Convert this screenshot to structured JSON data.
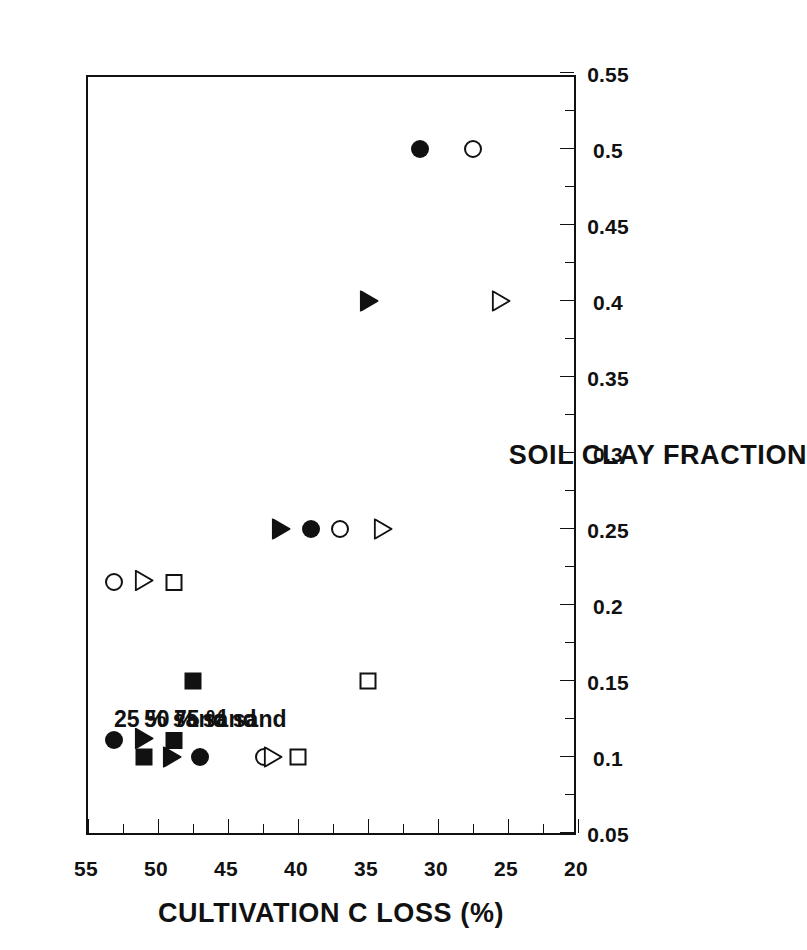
{
  "chart_data": {
    "type": "scatter",
    "title": "",
    "orientation": "rotated-90-ccw",
    "xlabel": "SOIL CLAY FRACTION",
    "ylabel": "CULTIVATION C LOSS (%)",
    "xlim": [
      0.05,
      0.55
    ],
    "ylim": [
      20,
      55
    ],
    "y_axis_inverted_on_screen": true,
    "grid": "dotted gridlines at every major y tick",
    "x_ticks": [
      "0.05",
      "0.1",
      "0.15",
      "0.2",
      "0.25",
      "0.3",
      "0.35",
      "0.4",
      "0.45",
      "0.5",
      "0.55"
    ],
    "x_tick_values": [
      0.05,
      0.1,
      0.15,
      0.2,
      0.25,
      0.3,
      0.35,
      0.4,
      0.45,
      0.5,
      0.55
    ],
    "x_minor_ticks": [
      0.075,
      0.125,
      0.175,
      0.225,
      0.275,
      0.325,
      0.375,
      0.425,
      0.475,
      0.525
    ],
    "y_ticks": [
      "55",
      "50",
      "45",
      "40",
      "35",
      "30",
      "25",
      "20"
    ],
    "y_tick_values": [
      55,
      50,
      45,
      40,
      35,
      30,
      25,
      20
    ],
    "y_minor_ticks": [
      52.5,
      47.5,
      42.5,
      37.5,
      32.5,
      27.5,
      22.5
    ],
    "y_gridline_values": [
      50,
      45,
      40,
      35,
      30,
      25
    ],
    "legend_position": "upper-right (on screen), logical upper-left",
    "legend_note": "each entry shows a filled marker (left) and an open marker (right)",
    "series": [
      {
        "name": "25 % sand",
        "label": "25 % sand",
        "filled_marker": "circle-filled",
        "open_marker": "circle-open",
        "points_filled": [
          {
            "x": 0.1,
            "y": 47.0
          },
          {
            "x": 0.25,
            "y": 39.1
          },
          {
            "x": 0.5,
            "y": 31.3
          }
        ],
        "points_open": [
          {
            "x": 0.1,
            "y": 42.4
          },
          {
            "x": 0.25,
            "y": 37.0
          },
          {
            "x": 0.5,
            "y": 27.5
          }
        ]
      },
      {
        "name": "50 % sand",
        "label": "50 % sand",
        "filled_marker": "triangle-filled",
        "open_marker": "triangle-open",
        "points_filled": [
          {
            "x": 0.1,
            "y": 49.0
          },
          {
            "x": 0.25,
            "y": 41.2
          },
          {
            "x": 0.4,
            "y": 34.9
          }
        ],
        "points_open": [
          {
            "x": 0.1,
            "y": 41.8
          },
          {
            "x": 0.25,
            "y": 33.9
          },
          {
            "x": 0.4,
            "y": 25.5
          }
        ]
      },
      {
        "name": "75 % sand",
        "label": "75 % sand",
        "filled_marker": "square-filled",
        "open_marker": "square-open",
        "points_filled": [
          {
            "x": 0.1,
            "y": 51.0
          },
          {
            "x": 0.15,
            "y": 47.5
          }
        ],
        "points_open": [
          {
            "x": 0.1,
            "y": 40.0
          },
          {
            "x": 0.15,
            "y": 35.0
          }
        ]
      }
    ]
  },
  "legend": {
    "entries": [
      {
        "label": "25 % sand"
      },
      {
        "label": "50 % sand"
      },
      {
        "label": "75 % sand"
      }
    ]
  },
  "axes": {
    "x_title": "SOIL CLAY FRACTION",
    "y_title": "CULTIVATION C LOSS (%)"
  },
  "colors": {
    "ink": "#111111",
    "background": "#ffffff",
    "gridline": "#2b2b2b"
  }
}
